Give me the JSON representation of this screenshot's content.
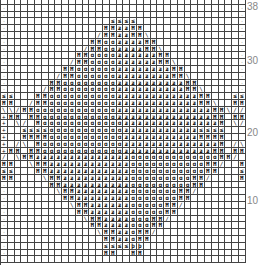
{
  "chart_data": {
    "type": "table",
    "title": "",
    "columns": 36,
    "rows": 39,
    "row_labels": [
      {
        "row": 38,
        "label": "38"
      },
      {
        "row": 30,
        "label": "30"
      },
      {
        "row": 20,
        "label": "20"
      },
      {
        "row": 10,
        "label": "10"
      }
    ],
    "legend": {
      ".": "dot",
      "H": "twisted-knit",
      "O": "loop-stitch",
      "Z": "twisted-zigzag",
      "/": "travel-right",
      "\\": "travel-left",
      "+": "cross-stitch",
      "e": "decrease-mark",
      " ": "blank"
    },
    "grid_top_to_bottom": [
      "                                    ",
      ".                                  .",
      ".                                  .",
      ".               eeee               .",
      ".              HHZZHH              .",
      ".             /HHZZHH\\             .",
      ".            HHOOZZZZHH            .",
      ".           /HHOOZZZZHH\\           .",
      ".          HHOOOOZZZZZZHH          .",
      ".         /HHOOOOZZZZZZHH\\         .",
      ".        HHOOOOOOZZZZZZZZHH        .",
      ".       /HHOOOOOOZZZZZZZZHH\\       .",
      ".      HHOOOOOOOOZZZZZZZZZZHH      .",
      ".     /HHOOOOOOOOZZZZZZZZZZHH\\     .",
      "ee   HHOOOOOOOOOOZZZZZZZZZZZZHH   ee",
      "HH  /HHOOOOOOOOOOZZZZZZZZZZZZHH\\  HH",
      "\\\\/HHOOOOOOOOOOOOZZZZZZZZZZZZZZHH\\//",
      "+HH HHOOOOOOOOOOOZZZZZZZZZZZZZZHH HH+",
      "+ \\/ HOOOOOOOOOOOOZZZZZZZZZZZZZZH \\/ +",
      "+  eeeeOOOOOOOOOOOZZZZZZZZZZZeeee   +",
      "+  HHHHOOOOOOOOOOOZZZZZZZZZZZHHHH   +",
      "+ /\\ HOOOOOOOOOOOOZZZZZZZZZZZZZZH /\\ +",
      "+HH HHOOOOOOOOOOOOZZZZZZZZZZZZZHH HH+",
      "/ \\HHZZZZZZZZZZZZZZOOOOOOOOOOOOOHH/ \\",
      "HH  \\HHZZZZZZZZZZZZOOOOOOOOOOOHH/  HH",
      "ee   HHZZZZZZZZZZZZOOOOOOOOOOOHH   ee",
      "HH    \\HHZZZZZZZZZZOOOOOOOOOHH/    HH",
      ".      HHZZZZZZZZZZOOOOOOOOOHH      .",
      ".       \\HHZZZZZZZZOOOOOOOHH/       .",
      ".        HHZZZZZZZZOOOOOOOHH        .",
      ".         \\HHZZZZZZOOOOOHH/         .",
      ".          HHZZZZZZOOOOOHH          .",
      ".           \\HHZZZZOOOHH/           .",
      ".            HHZZZZOOOHH            .",
      ".             \\HHZZOHH/             .",
      ".              HHZZOHH              .",
      ".              eeeepp               .",
      ".              HH  HH               .",
      ".                                  ."
    ]
  }
}
